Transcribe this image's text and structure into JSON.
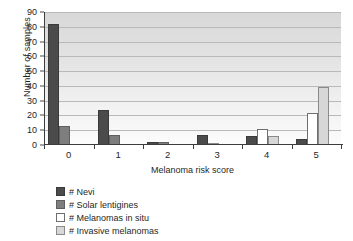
{
  "chart_data": {
    "type": "bar",
    "title": "",
    "xlabel": "Melanoma risk score",
    "ylabel": "Number of samples",
    "categories": [
      "0",
      "1",
      "2",
      "3",
      "4",
      "5"
    ],
    "ylim": [
      0,
      90
    ],
    "yticks": [
      0,
      10,
      20,
      30,
      40,
      50,
      60,
      70,
      80,
      90
    ],
    "grid": true,
    "legend_position": "below-left",
    "series": [
      {
        "name": "# Nevi",
        "color": "#4b4b4b",
        "values": [
          82,
          24,
          2,
          7,
          6,
          4
        ]
      },
      {
        "name": "# Solar lentigines",
        "color": "#7e7e7e",
        "values": [
          13,
          7,
          2,
          0,
          0,
          0
        ]
      },
      {
        "name": "# Melanomas in situ",
        "color": "#ffffff",
        "values": [
          0,
          0,
          0,
          0,
          11,
          22
        ]
      },
      {
        "name": "# Invasive melanomas",
        "color": "#d7d7d7",
        "values": [
          0,
          0,
          0,
          1,
          6,
          39
        ]
      }
    ]
  }
}
